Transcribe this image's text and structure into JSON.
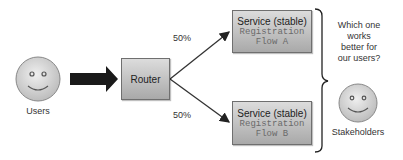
{
  "users": {
    "label": "Users"
  },
  "router": {
    "label": "Router"
  },
  "split": {
    "top_pct": "50%",
    "bottom_pct": "50%"
  },
  "service_a": {
    "title": "Service (stable)",
    "line1": "Registration",
    "line2": "Flow A"
  },
  "service_b": {
    "title": "Service (stable)",
    "line1": "Registration",
    "line2": "Flow B"
  },
  "question": {
    "line1": "Which one",
    "line2": "works",
    "line3": "better for",
    "line4": "our users?"
  },
  "stakeholders": {
    "label": "Stakeholders"
  },
  "colors": {
    "box_top": "#dcdcdc",
    "box_bottom": "#a9a9a9",
    "face": "#d6d6d6",
    "arrow": "#1a1a1a"
  }
}
